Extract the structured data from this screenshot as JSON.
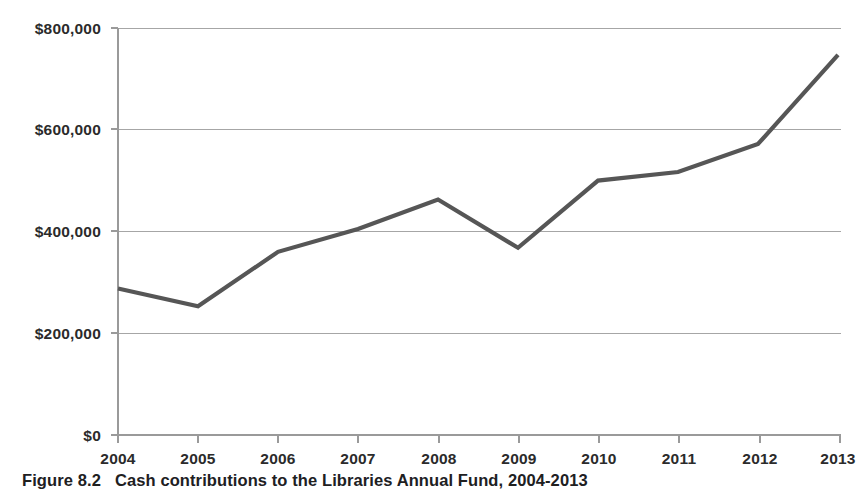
{
  "figure": {
    "caption_number": "Figure 8.2",
    "caption_text": "Cash contributions to the Libraries Annual Fund, 2004-2013"
  },
  "chart_data": {
    "type": "line",
    "title": "",
    "subtitle": "",
    "xlabel": "",
    "ylabel": "",
    "x": [
      2004,
      2005,
      2006,
      2007,
      2008,
      2009,
      2010,
      2011,
      2012,
      2013
    ],
    "categories": [
      "2004",
      "2005",
      "2006",
      "2007",
      "2008",
      "2009",
      "2010",
      "2011",
      "2012",
      "2013"
    ],
    "values": [
      288000,
      253000,
      360000,
      405000,
      463000,
      368000,
      500000,
      517000,
      572000,
      747000
    ],
    "series": [
      {
        "name": "Cash contributions",
        "values": [
          288000,
          253000,
          360000,
          405000,
          463000,
          368000,
          500000,
          517000,
          572000,
          747000
        ],
        "color": "#565656"
      }
    ],
    "ylim": [
      0,
      800000
    ],
    "yticks": [
      0,
      200000,
      400000,
      600000,
      800000
    ],
    "ytick_labels": [
      "$0",
      "$200,000",
      "$400,000",
      "$600,000",
      "$800,000"
    ],
    "xtick_labels": [
      "2004",
      "2005",
      "2006",
      "2007",
      "2008",
      "2009",
      "2010",
      "2011",
      "2012",
      "2013"
    ],
    "grid": "horizontal",
    "legend": "none",
    "markers": "none",
    "gridline_color": "#a6a6a6",
    "axis_color": "#9a9a9a",
    "background_color": "#ffffff"
  }
}
